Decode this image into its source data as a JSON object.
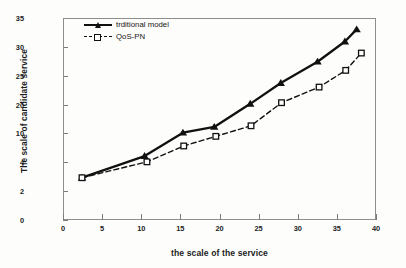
{
  "chart_data": {
    "type": "line",
    "title": "",
    "xlabel": "the scale of the service",
    "ylabel": "The scale of candidate service",
    "xlim": [
      0,
      40
    ],
    "xticks": [
      0,
      5,
      10,
      15,
      20,
      25,
      30,
      35,
      40
    ],
    "yticks": [
      0,
      2,
      4,
      10,
      20,
      25,
      30,
      35
    ],
    "ylim": [
      0,
      35
    ],
    "y_axis_note": "tick labels are unevenly valued but evenly spaced",
    "grid": false,
    "legend_position": "top-left inside axes",
    "series": [
      {
        "name": "trditional model",
        "marker": "filled-triangle",
        "linestyle": "solid",
        "color": "#111111",
        "points": [
          {
            "x": 2.3,
            "y": 3.0
          },
          {
            "x": 10.3,
            "y": 5.5
          },
          {
            "x": 15.2,
            "y": 10.6
          },
          {
            "x": 19.2,
            "y": 12.6
          },
          {
            "x": 23.8,
            "y": 20.3
          },
          {
            "x": 27.7,
            "y": 23.9
          },
          {
            "x": 32.4,
            "y": 27.6
          },
          {
            "x": 35.9,
            "y": 31.1
          },
          {
            "x": 37.4,
            "y": 33.2
          }
        ]
      },
      {
        "name": "QoS-PN",
        "marker": "open-square",
        "linestyle": "dashed",
        "color": "#111111",
        "points": [
          {
            "x": 2.3,
            "y": 3.0
          },
          {
            "x": 10.6,
            "y": 4.3
          },
          {
            "x": 15.3,
            "y": 7.6
          },
          {
            "x": 19.4,
            "y": 9.6
          },
          {
            "x": 23.9,
            "y": 13.0
          },
          {
            "x": 27.8,
            "y": 20.5
          },
          {
            "x": 32.6,
            "y": 23.2
          },
          {
            "x": 36.0,
            "y": 26.1
          },
          {
            "x": 38.0,
            "y": 29.1
          }
        ]
      }
    ]
  },
  "legend": {
    "items": [
      {
        "label": "trditional model"
      },
      {
        "label": "QoS-PN"
      }
    ]
  },
  "colors": {
    "line": "#111111",
    "axis": "#8e8e8e",
    "text": "#1c1c1c",
    "background": "#fdfdfc"
  }
}
